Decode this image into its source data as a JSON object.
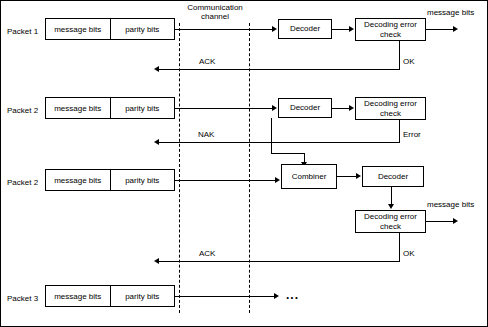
{
  "diagram": {
    "title_channel": "Communication\nchannel",
    "channel_label_line1": "Communication",
    "channel_label_line2": "channel",
    "packets": [
      {
        "name": "Packet 1",
        "message": "message bits",
        "parity": "parity bits"
      },
      {
        "name": "Packet 2",
        "message": "message bits",
        "parity": "parity bits"
      },
      {
        "name": "Packet 2",
        "message": "message bits",
        "parity": "parity bits"
      },
      {
        "name": "Packet 3",
        "message": "message bits",
        "parity": "parity bits"
      }
    ],
    "blocks": {
      "decoder1": "Decoder",
      "decoder2": "Decoder",
      "decoder3": "Decoder",
      "combiner": "Combiner",
      "errcheck1_line1": "Decoding error",
      "errcheck1_line2": "check",
      "errcheck2_line1": "Decoding error",
      "errcheck2_line2": "check",
      "errcheck3_line1": "Decoding error",
      "errcheck3_line2": "check"
    },
    "annotations": {
      "message_bits_out1": "message bits",
      "message_bits_out2": "message bits",
      "ok1": "OK",
      "ok2": "OK",
      "error": "Error",
      "ack1": "ACK",
      "nak": "NAK",
      "ack2": "ACK",
      "ellipsis": "..."
    }
  }
}
